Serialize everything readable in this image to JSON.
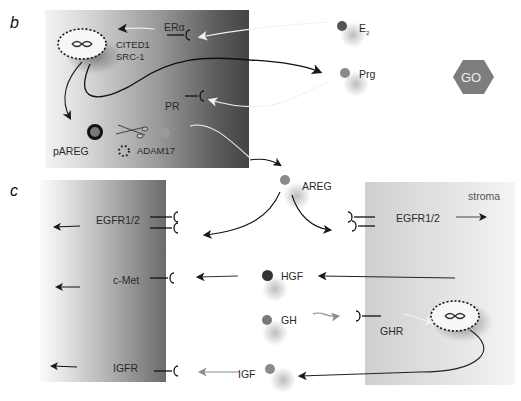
{
  "panels": {
    "b": {
      "letter": "b",
      "labels": {
        "er": "ERα",
        "cited1": "CITED1",
        "src1": "SRC-1",
        "pr": "PR",
        "pareg": "pAREG",
        "adam17": "ADAM17",
        "e2_main": "E",
        "e2_sub": "2",
        "prg": "Prg"
      },
      "go_badge": "GO"
    },
    "c": {
      "letter": "c",
      "labels": {
        "egfr_left": "EGFR1/2",
        "cmet": "c-Met",
        "igfr": "IGFR",
        "areg": "AREG",
        "hgf": "HGF",
        "gh": "GH",
        "igf": "IGF",
        "egfr_right": "EGFR1/2",
        "ghr": "GHR",
        "stroma": "stroma"
      }
    }
  },
  "colors": {
    "ligand_dark": "#3a3a3a",
    "ligand_mid": "#7a7a7a",
    "go_hex": "#7d7d7d",
    "arrow": "#1a1a1a"
  }
}
